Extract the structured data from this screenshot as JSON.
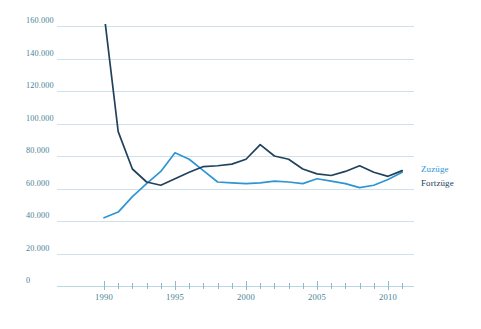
{
  "chart_data": {
    "type": "line",
    "title": "",
    "xlabel": "",
    "ylabel": "",
    "xlim": [
      1990,
      2011
    ],
    "ylim": [
      0,
      160000
    ],
    "grid": true,
    "legend_position": "right",
    "y_ticks": [
      0,
      20000,
      40000,
      60000,
      80000,
      100000,
      120000,
      140000,
      160000
    ],
    "y_tick_labels": [
      "0",
      "20.000",
      "40.000",
      "60.000",
      "80.000",
      "100.000",
      "120.000",
      "140.000",
      "160.000"
    ],
    "x_ticks": [
      1990,
      1991,
      1992,
      1993,
      1994,
      1995,
      1996,
      1997,
      1998,
      1999,
      2000,
      2001,
      2002,
      2003,
      2004,
      2005,
      2006,
      2007,
      2008,
      2009,
      2010,
      2011
    ],
    "x_tick_labels": [
      "1990",
      "1995",
      "2000",
      "2005",
      "2010"
    ],
    "x_labeled_years": [
      1990,
      1995,
      2000,
      2005,
      2010
    ],
    "x": [
      1990,
      1991,
      1992,
      1993,
      1994,
      1995,
      1996,
      1997,
      1998,
      1999,
      2000,
      2001,
      2002,
      2003,
      2004,
      2005,
      2006,
      2007,
      2008,
      2009,
      2010,
      2011
    ],
    "series": [
      {
        "name": "Zuzüge",
        "color": "#2E95D4",
        "values": [
          42000,
          45500,
          55000,
          63000,
          70500,
          82000,
          78000,
          71000,
          64000,
          63500,
          63000,
          63500,
          64500,
          64000,
          63000,
          66000,
          64500,
          63000,
          60500,
          62000,
          65500,
          70000
        ]
      },
      {
        "name": "Fortzüge",
        "color": "#21425C",
        "values": [
          168000,
          95000,
          72000,
          64000,
          62000,
          66000,
          70000,
          73500,
          74000,
          75000,
          78000,
          87000,
          80000,
          78000,
          72000,
          69000,
          68000,
          70500,
          74000,
          70000,
          67500,
          71000
        ]
      }
    ],
    "legend": [
      {
        "label": "Zuzüge",
        "color": "#2E95D4"
      },
      {
        "label": "Fortzüge",
        "color": "#21425C"
      }
    ]
  },
  "axis": {
    "y_label_0": "0",
    "y_label_1": "20.000",
    "y_label_2": "40.000",
    "y_label_3": "60.000",
    "y_label_4": "80.000",
    "y_label_5": "100.000",
    "y_label_6": "120.000",
    "y_label_7": "140.000",
    "y_label_8": "160.000",
    "x_label_0": "1990",
    "x_label_1": "1995",
    "x_label_2": "2000",
    "x_label_3": "2005",
    "x_label_4": "2010"
  },
  "legend": {
    "zuzuege_label": "Zuzüge",
    "fortzuege_label": "Fortzüge"
  },
  "colors": {
    "zuzuege": "#2E95D4",
    "fortzuege": "#21425C",
    "gridline": "#cfe2ec",
    "axis_text": "#4a7f96",
    "background": "#ffffff"
  }
}
